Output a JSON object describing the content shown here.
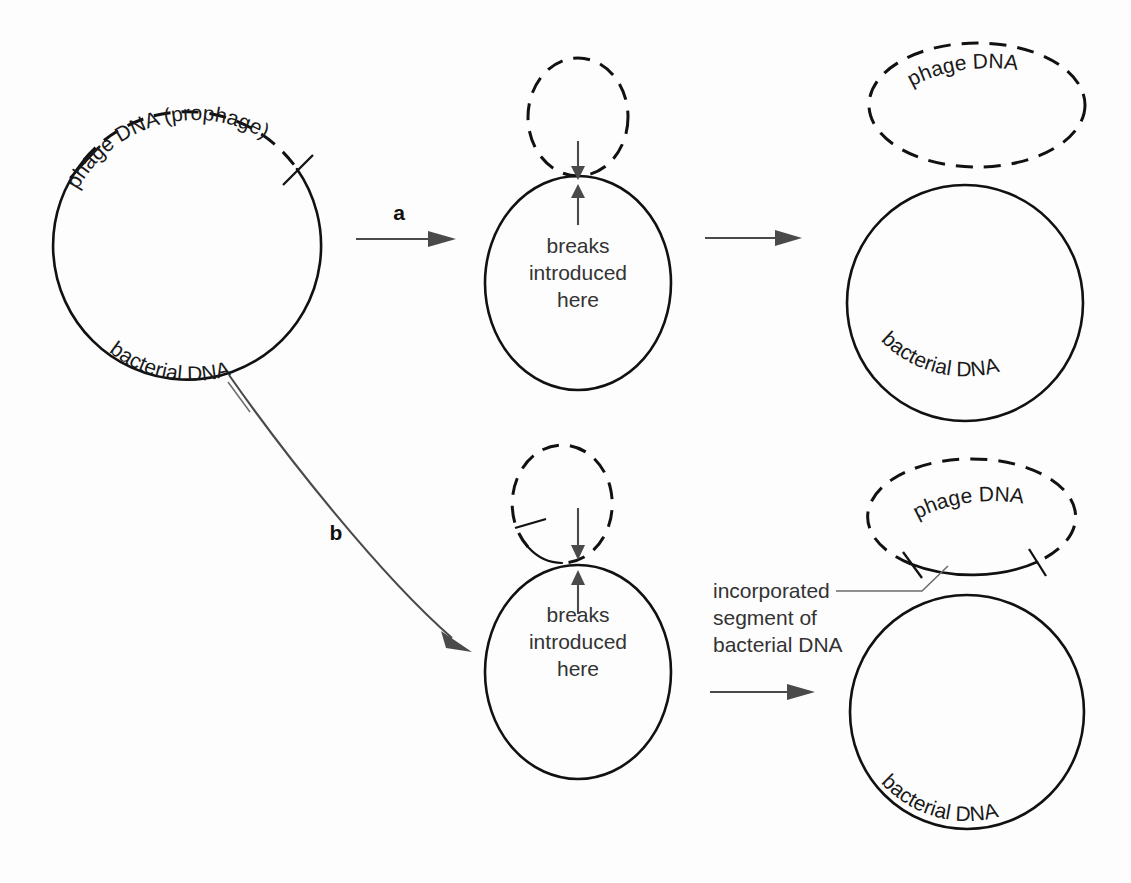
{
  "figure": {
    "background_color": "#fdfdfd",
    "ink_color": "#111111",
    "arrow_color": "#4a4a4a"
  },
  "labels": {
    "phage_dna_prophage": "phage DNA (prophage)",
    "bacterial_dna": "bacterial DNA",
    "phage_dna": "phage DNA",
    "breaks_line1": "breaks",
    "breaks_line2": "introduced",
    "breaks_line3": "here",
    "incorporated_line1": "incorporated",
    "incorporated_line2": "segment of",
    "incorporated_line3": "bacterial DNA",
    "step_a": "a",
    "step_b": "b"
  },
  "panels": [
    {
      "id": "start",
      "name": "integrated-prophage-circle",
      "description": "Large circle with dashed upper arc representing integrated phage DNA and solid lower arc representing bacterial DNA, bounded by two tick marks",
      "labels": [
        "phage DNA (prophage)",
        "bacterial DNA"
      ]
    },
    {
      "id": "pathway-a-intermediate",
      "name": "normal-excision-intermediate",
      "description": "Dashed small loop above solid large ellipse joined at one point with two converging arrows marking break sites",
      "labels": [
        "breaks introduced here"
      ]
    },
    {
      "id": "pathway-a-result",
      "name": "normal-excision-products",
      "description": "Dashed ellipse of pure phage DNA above a solid circle of intact bacterial DNA",
      "labels": [
        "phage DNA",
        "bacterial DNA"
      ]
    },
    {
      "id": "pathway-b-intermediate",
      "name": "aberrant-excision-intermediate",
      "description": "Dashed small loop with a solid lower-left arc above solid large ellipse, joined with two converging arrows marking break sites offset from the attachment point",
      "labels": [
        "breaks introduced here"
      ]
    },
    {
      "id": "pathway-b-result",
      "name": "aberrant-excision-products",
      "description": "Dashed ellipse with a solid bottom arc marked by two ticks, representing phage DNA carrying an incorporated bacterial segment, above a solid bacterial circle",
      "labels": [
        "phage DNA",
        "incorporated segment of bacterial DNA",
        "bacterial DNA"
      ]
    }
  ],
  "pathways": [
    {
      "key": "a",
      "label": "a",
      "name": "pathway-a-arrow",
      "style": "straight"
    },
    {
      "key": "b",
      "label": "b",
      "name": "pathway-b-arrow",
      "style": "curved"
    }
  ]
}
